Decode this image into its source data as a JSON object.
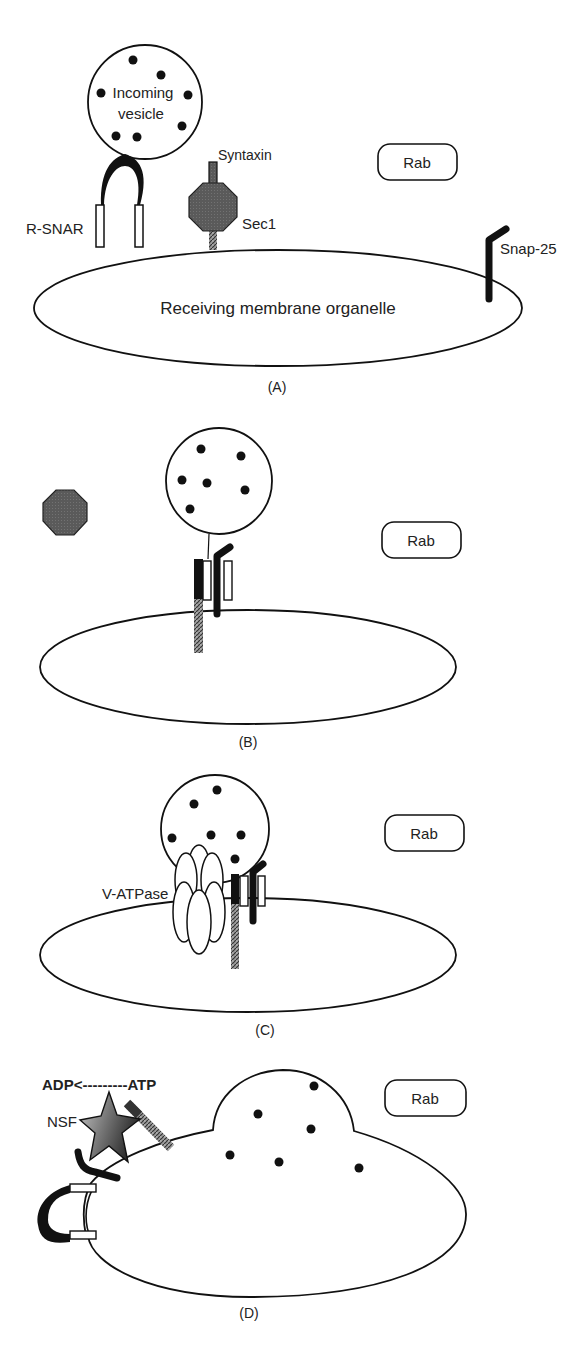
{
  "diagram": {
    "type": "SNARE-mediated vesicle fusion stages",
    "colors": {
      "stroke": "#111111",
      "background": "#ffffff",
      "sec1_fill": "#555555",
      "hatched": "#666666",
      "snap25": "#111111"
    },
    "panels": [
      {
        "id": "A",
        "caption": "(A)",
        "labels": {
          "vesicle_line1": "Incoming",
          "vesicle_line2": "vesicle",
          "rsnare": "R-SNAR",
          "syntaxin": "Syntaxin",
          "sec1": "Sec1",
          "snap25": "Snap-25",
          "organelle": "Receiving membrane organelle",
          "rab": "Rab"
        }
      },
      {
        "id": "B",
        "caption": "(B)",
        "labels": {
          "rab": "Rab"
        }
      },
      {
        "id": "C",
        "caption": "(C)",
        "labels": {
          "vatpase": "V-ATPase",
          "rab": "Rab"
        }
      },
      {
        "id": "D",
        "caption": "(D)",
        "labels": {
          "reaction": "ADP<---------ATP",
          "nsf": "NSF",
          "rab": "Rab"
        }
      }
    ]
  }
}
